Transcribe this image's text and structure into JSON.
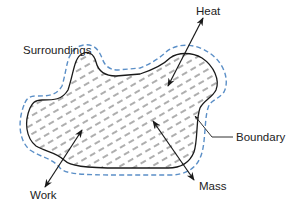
{
  "diagram": {
    "type": "thermodynamic-system",
    "labels": {
      "surroundings": "Surroundings",
      "heat": "Heat",
      "boundary": "Boundary",
      "work": "Work",
      "mass": "Mass"
    },
    "colors": {
      "system_outline": "#1a1a1a",
      "boundary_dashed": "#5b8fc7",
      "hatch": "#333333",
      "arrow": "#1a1a1a",
      "text": "#222222"
    },
    "arrows": [
      {
        "name": "heat",
        "direction": "bidirectional"
      },
      {
        "name": "work",
        "direction": "bidirectional"
      },
      {
        "name": "mass",
        "direction": "bidirectional"
      }
    ]
  }
}
